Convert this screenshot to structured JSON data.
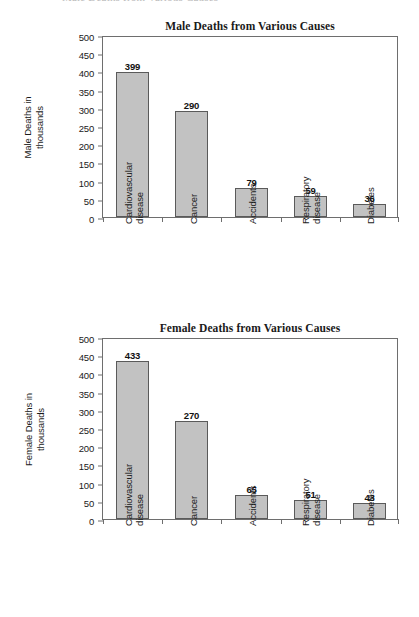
{
  "page": {
    "cropped_header_text": "Male Deaths from Various Causes"
  },
  "chart_data": [
    {
      "type": "bar",
      "title": "Male Deaths from Various Causes",
      "xlabel": "",
      "ylabel": "Male Deaths in thousands",
      "ylabel_lines": [
        "Male Deaths in",
        "thousands"
      ],
      "categories": [
        "Cardiovascular disease",
        "Cancer",
        "Accidents",
        "Respiratory disease",
        "Diabetes"
      ],
      "category_lines": [
        [
          "Cardiovascular",
          "disease"
        ],
        [
          "Cancer",
          ""
        ],
        [
          "Accidents",
          ""
        ],
        [
          "Respiratory",
          "disease"
        ],
        [
          "Diabetes",
          ""
        ]
      ],
      "values": [
        399,
        290,
        79,
        59,
        36
      ],
      "value_labels": [
        "399",
        "290",
        "79",
        "59",
        "36"
      ],
      "ylim": [
        0,
        500
      ],
      "yticks": [
        0,
        50,
        100,
        150,
        200,
        250,
        300,
        350,
        400,
        450,
        500
      ],
      "ytick_labels": [
        "0",
        "50",
        "100",
        "150",
        "200",
        "250",
        "300",
        "350",
        "400",
        "450",
        "500"
      ],
      "grid": false,
      "legend": "none",
      "bar_color": "#c2c2c2",
      "bar_border_color": "#5a5a5a",
      "axis_color": "#6e6e6e"
    },
    {
      "type": "bar",
      "title": "Female Deaths from Various Causes",
      "xlabel": "",
      "ylabel": "Female Deaths in thousands",
      "ylabel_lines": [
        "Female Deaths in",
        "thousands"
      ],
      "categories": [
        "Cardiovascular disease",
        "Cancer",
        "Accidents",
        "Respiratory disease",
        "Diabetes"
      ],
      "category_lines": [
        [
          "Cardiovascular",
          "disease"
        ],
        [
          "Cancer",
          ""
        ],
        [
          "Accidents",
          ""
        ],
        [
          "Respiratory",
          "disease"
        ],
        [
          "Diabetes",
          ""
        ]
      ],
      "values": [
        433,
        270,
        65,
        51,
        43
      ],
      "value_labels": [
        "433",
        "270",
        "65",
        "51",
        "43"
      ],
      "ylim": [
        0,
        500
      ],
      "yticks": [
        0,
        50,
        100,
        150,
        200,
        250,
        300,
        350,
        400,
        450,
        500
      ],
      "ytick_labels": [
        "0",
        "50",
        "100",
        "150",
        "200",
        "250",
        "300",
        "350",
        "400",
        "450",
        "500"
      ],
      "grid": false,
      "legend": "none",
      "bar_color": "#c2c2c2",
      "bar_border_color": "#5a5a5a",
      "axis_color": "#6e6e6e"
    }
  ]
}
